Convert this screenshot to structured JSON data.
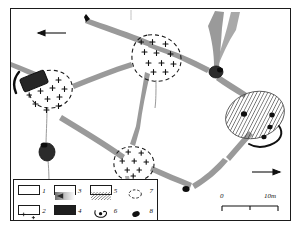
{
  "figure": {
    "type": "archaeological-site-plan",
    "title": "",
    "background_color": "#ffffff",
    "frame_color": "#1b1b1b"
  },
  "colors": {
    "wall_gray": "#9a9a9a",
    "wall_gray_dark": "#7d7d7d",
    "ink_black": "#1b1b1b",
    "fill_black": "#2a2a2a",
    "hatch_line": "#3a3a3a",
    "paper": "#ffffff"
  },
  "legend": {
    "items": [
      {
        "number": "1",
        "icon": "white-rectangle-swatch",
        "style": "open"
      },
      {
        "number": "2",
        "icon": "cross-marked-rectangle-swatch",
        "style": "crosses"
      },
      {
        "number": "3",
        "icon": "gray-gradient-rectangle-swatch",
        "style": "gray"
      },
      {
        "number": "4",
        "icon": "black-rectangle-swatch",
        "style": "black"
      },
      {
        "number": "5",
        "icon": "hatched-rectangle-swatch",
        "style": "hatch"
      },
      {
        "number": "6",
        "icon": "vessel-with-dot-symbol",
        "style": "vessel"
      },
      {
        "number": "7",
        "icon": "dashed-ellipse-symbol",
        "style": "dashed-ellipse"
      },
      {
        "number": "8",
        "icon": "filled-ellipse-symbol",
        "style": "filled-ellipse"
      }
    ]
  },
  "scale_bar": {
    "start_label": "0",
    "end_label": "10m",
    "ticks": 2
  },
  "arrows": [
    {
      "name": "north-arrow-upper-left",
      "direction": "left"
    },
    {
      "name": "flow-arrow-lower-right",
      "direction": "right"
    }
  ],
  "map_features": {
    "dashed_ellipses": [
      {
        "name": "ellipse-west",
        "cx": 52,
        "cy": 92,
        "rx": 21,
        "ry": 18,
        "crosses": 11
      },
      {
        "name": "ellipse-central",
        "cx": 157,
        "cy": 57,
        "rx": 24,
        "ry": 22,
        "crosses": 11
      },
      {
        "name": "ellipse-south",
        "cx": 135,
        "cy": 163,
        "rx": 19,
        "ry": 16,
        "crosses": 8
      }
    ],
    "hatched_area": {
      "name": "hatched-ellipse-east",
      "cx": 255,
      "cy": 115,
      "rx": 30,
      "ry": 23
    },
    "black_features": [
      {
        "name": "black-block-west",
        "cx": 33,
        "cy": 84
      },
      {
        "name": "black-blob-southwest",
        "cx": 47,
        "cy": 152
      },
      {
        "name": "black-node-northeast",
        "cx": 216,
        "cy": 72
      },
      {
        "name": "black-dot-south",
        "cx": 186,
        "cy": 190
      },
      {
        "name": "black-dot-north",
        "cx": 88,
        "cy": 18
      }
    ],
    "finds_dots": [
      {
        "name": "find-dot-1",
        "cx": 244,
        "cy": 114
      },
      {
        "name": "find-dot-2",
        "cx": 272,
        "cy": 115
      },
      {
        "name": "find-dot-3",
        "cx": 270,
        "cy": 127
      },
      {
        "name": "find-dot-4",
        "cx": 264,
        "cy": 136
      }
    ]
  }
}
